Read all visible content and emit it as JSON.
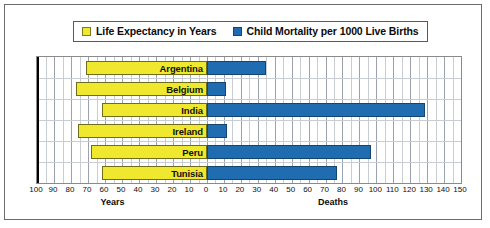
{
  "legend": {
    "entries": [
      {
        "label": "Life Expectancy in Years",
        "color": "#efe82e",
        "swatch": "yellow-square-icon"
      },
      {
        "label": "Child Mortality per 1000 Live Births",
        "color": "#1f6cb0",
        "swatch": "blue-square-icon"
      }
    ]
  },
  "axis": {
    "left_title": "Years",
    "right_title": "Deaths",
    "left_ticks": [
      100,
      90,
      80,
      70,
      60,
      50,
      40,
      30,
      20,
      10,
      0
    ],
    "right_ticks": [
      0,
      10,
      20,
      30,
      40,
      50,
      60,
      70,
      80,
      90,
      100,
      110,
      120,
      130,
      140,
      150
    ]
  },
  "chart_data": {
    "type": "bar",
    "title": "",
    "subtitle": "",
    "orientation": "horizontal-diverging",
    "categories": [
      "Argentina",
      "Belgium",
      "India",
      "Ireland",
      "Peru",
      "Tunisia"
    ],
    "series": [
      {
        "name": "Life Expectancy in Years",
        "color": "#efe82e",
        "direction": "left",
        "axis": "Years",
        "values": [
          71,
          77,
          62,
          76,
          68,
          62
        ]
      },
      {
        "name": "Child Mortality per 1000 Live Births",
        "color": "#1f6cb0",
        "direction": "right",
        "axis": "Deaths",
        "values": [
          35,
          11,
          129,
          12,
          97,
          77
        ]
      }
    ],
    "xlabel_left": "Years",
    "xlabel_right": "Deaths",
    "ylabel": "",
    "xlim_left": [
      0,
      100
    ],
    "xlim_right": [
      0,
      150
    ],
    "grid": true,
    "legend_position": "top"
  }
}
